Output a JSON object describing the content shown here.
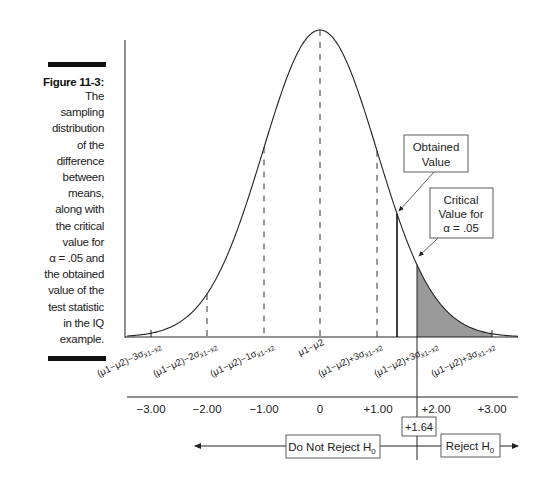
{
  "figure": {
    "label": "Figure 11-3:",
    "caption_lines": [
      "The",
      "sampling",
      "distribution",
      "of the",
      "difference",
      "between",
      "means,",
      "along with",
      "the critical",
      "value for",
      "α = .05 and",
      "the obtained",
      "value of the",
      "test statistic",
      "in the IQ",
      "example."
    ]
  },
  "callouts": {
    "obtained": [
      "Obtained",
      "Value"
    ],
    "critical": [
      "Critical",
      "Value for",
      "α = .05"
    ]
  },
  "rotated_labels": [
    {
      "base": "(μ1−μ2)−3σ",
      "sub": "x̄1−x̄2"
    },
    {
      "base": "(μ1−μ2)−2σ",
      "sub": "x̄1−x̄2"
    },
    {
      "base": "(μ1−μ2)−1σ",
      "sub": "x̄1−x̄2"
    },
    {
      "base": "μ1−μ2",
      "sub": ""
    },
    {
      "base": "(μ1−μ2)+3σ",
      "sub": "x̄1−x̄2"
    },
    {
      "base": "(μ1−μ2)+3σ",
      "sub": "x̄1−x̄2"
    },
    {
      "base": "(μ1−μ2)+3σ",
      "sub": "x̄1−x̄2"
    }
  ],
  "z_scale": {
    "ticks": [
      "−3.00",
      "−2.00",
      "−1.00",
      "0",
      "+1.00",
      "+2.00",
      "+3.00"
    ],
    "critical_value": "+1.64"
  },
  "decision": {
    "do_not_reject": "Do Not Reject H",
    "reject": "Reject H",
    "subscript": "0"
  },
  "chart_data": {
    "type": "area",
    "title": "Sampling distribution of the difference between means",
    "x": [
      -3,
      -2,
      -1,
      0,
      1,
      1.64,
      2,
      3
    ],
    "distribution": "normal",
    "critical_value": 1.64,
    "alpha": 0.05,
    "obtained_value": 1.36,
    "shaded_region": [
      1.64,
      3.0
    ],
    "xlabel": "z",
    "tick_labels": [
      "−3.00",
      "−2.00",
      "−1.00",
      "0",
      "+1.00",
      "+2.00",
      "+3.00"
    ],
    "regions": [
      "Do Not Reject H0",
      "Reject H0"
    ]
  },
  "colors": {
    "line": "#222222",
    "shade": "#9a9a9a"
  }
}
